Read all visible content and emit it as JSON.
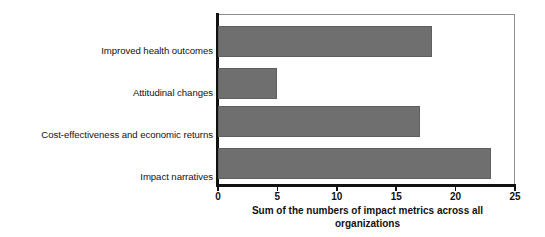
{
  "chart_data": {
    "type": "bar",
    "orientation": "horizontal",
    "title": "",
    "categories": [
      "Improved health outcomes",
      "Attitudinal changes",
      "Cost-effectiveness and economic returns",
      "Impact narratives"
    ],
    "values": [
      18,
      5,
      17,
      23
    ],
    "xlabel_line1": "Sum of the numbers of impact metrics across all",
    "xlabel_line2": "organizations",
    "ylabel": "",
    "xlim": [
      0,
      25
    ],
    "xticks": [
      0,
      5,
      10,
      15,
      20,
      25
    ],
    "xtick_labels": [
      "0",
      "5",
      "10",
      "15",
      "20",
      "25"
    ],
    "grid": false,
    "legend": false,
    "bar_color": "#6f6f6f",
    "axis_color": "#111111",
    "frame_color": "#8e8e8e",
    "background": "#ffffff"
  }
}
